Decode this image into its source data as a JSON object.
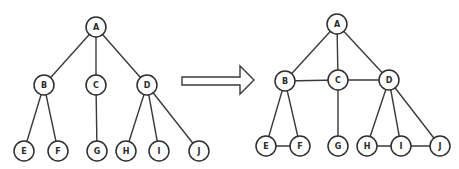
{
  "diagram": {
    "title": "",
    "colors": {
      "stroke": "#2e2e2e",
      "node_fill": "#ffffff",
      "background": "#ffffff"
    },
    "left_graph": {
      "name": "tree",
      "nodes": [
        "A",
        "B",
        "C",
        "D",
        "E",
        "F",
        "G",
        "H",
        "I",
        "J"
      ],
      "edges": [
        [
          "A",
          "B"
        ],
        [
          "A",
          "C"
        ],
        [
          "A",
          "D"
        ],
        [
          "B",
          "E"
        ],
        [
          "B",
          "F"
        ],
        [
          "C",
          "G"
        ],
        [
          "D",
          "H"
        ],
        [
          "D",
          "I"
        ],
        [
          "D",
          "J"
        ]
      ]
    },
    "transform_arrow": {
      "direction": "right",
      "style": "outlined"
    },
    "right_graph": {
      "name": "graph-with-sibling-edges",
      "nodes": [
        "A",
        "B",
        "C",
        "D",
        "E",
        "F",
        "G",
        "H",
        "I",
        "J"
      ],
      "edges": [
        [
          "A",
          "B"
        ],
        [
          "A",
          "C"
        ],
        [
          "A",
          "D"
        ],
        [
          "B",
          "C"
        ],
        [
          "C",
          "D"
        ],
        [
          "B",
          "E"
        ],
        [
          "B",
          "F"
        ],
        [
          "E",
          "F"
        ],
        [
          "C",
          "G"
        ],
        [
          "D",
          "H"
        ],
        [
          "D",
          "I"
        ],
        [
          "D",
          "J"
        ],
        [
          "H",
          "I"
        ],
        [
          "I",
          "J"
        ]
      ]
    }
  }
}
